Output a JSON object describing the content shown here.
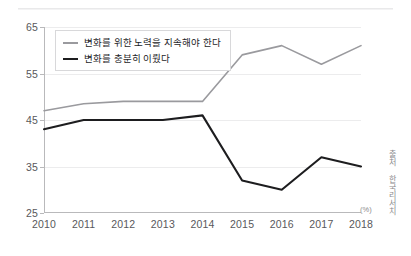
{
  "chart_data": {
    "type": "line",
    "title": "",
    "xlabel": "",
    "ylabel": "",
    "unit_label": "(%)",
    "source": "출처 한국리서치",
    "categories": [
      "2010",
      "2011",
      "2012",
      "2013",
      "2014",
      "2015",
      "2016",
      "2017",
      "2018"
    ],
    "ylim": [
      25,
      65
    ],
    "yticks": [
      25,
      35,
      45,
      55,
      65
    ],
    "grid": true,
    "legend_position": "top-left",
    "series": [
      {
        "name": "변화를 위한 노력을 지속해야 한다",
        "color": "#9a9a9e",
        "values": [
          47,
          48.5,
          49,
          49,
          49,
          59,
          61,
          57,
          61
        ]
      },
      {
        "name": "변화를 충분히 이뤘다",
        "color": "#1d1d1f",
        "values": [
          43,
          45,
          45,
          45,
          46,
          32,
          30,
          37,
          35
        ]
      }
    ]
  }
}
